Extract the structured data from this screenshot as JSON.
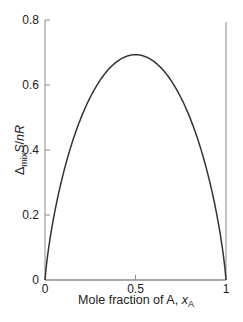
{
  "chart_data": {
    "type": "line",
    "title": "",
    "xlabel": "Mole fraction of A, x_A",
    "xlabel_parts": {
      "text": "Mole fraction of A, ",
      "var": "x",
      "sub": "A"
    },
    "ylabel": "Δ_mix S/nR",
    "ylabel_parts": {
      "delta": "Δ",
      "sub": "mix",
      "rest": "S/",
      "n": "n",
      "R": "R"
    },
    "xlim": [
      0,
      1
    ],
    "ylim": [
      0,
      0.8
    ],
    "x_ticks": [
      0,
      0.5,
      1
    ],
    "x_tick_labels": [
      "0",
      "0.5",
      "1"
    ],
    "y_ticks": [
      0,
      0.2,
      0.4,
      0.6,
      0.8
    ],
    "y_tick_labels": [
      "0",
      "0.2",
      "0.4",
      "0.6",
      "0.8"
    ],
    "grid": false,
    "legend": null,
    "series": [
      {
        "name": "-[x ln x + (1-x) ln(1-x)]",
        "x": [
          0,
          0.01,
          0.05,
          0.1,
          0.2,
          0.3,
          0.4,
          0.5,
          0.6,
          0.7,
          0.8,
          0.9,
          0.95,
          0.99,
          1
        ],
        "y": [
          0,
          0.056,
          0.199,
          0.325,
          0.5,
          0.611,
          0.673,
          0.693,
          0.673,
          0.611,
          0.5,
          0.325,
          0.199,
          0.056,
          0
        ],
        "color": "#333333"
      }
    ],
    "annotations": [
      {
        "type": "vertical-line",
        "x": 1,
        "y_range": [
          0,
          0.8
        ],
        "color": "#9a9a9a"
      }
    ]
  }
}
